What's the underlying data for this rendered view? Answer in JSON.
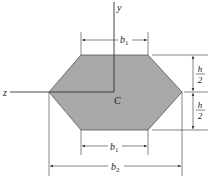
{
  "diagram": {
    "axes": {
      "y_label": "y",
      "z_label": "z"
    },
    "centroid_label": "C",
    "dimensions": {
      "top_width": {
        "var": "b",
        "sub": "1"
      },
      "bottom_width": {
        "var": "b",
        "sub": "1"
      },
      "overall_width": {
        "var": "b",
        "sub": "2"
      },
      "upper_half_height": {
        "num": "h",
        "den": "2"
      },
      "lower_half_height": {
        "num": "h",
        "den": "2"
      }
    },
    "colors": {
      "fill": "#a8a8a8",
      "line": "#333333"
    }
  }
}
